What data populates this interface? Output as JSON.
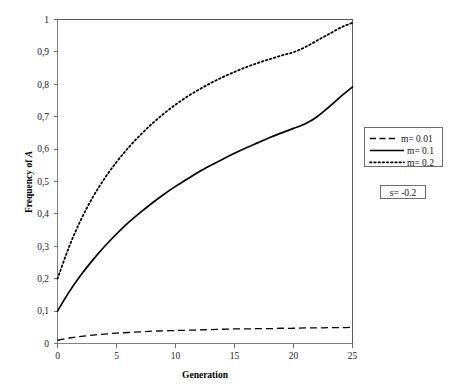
{
  "chart_data": {
    "type": "line",
    "title": "",
    "xlabel": "Generation",
    "ylabel": "Frequency of A",
    "ylabel_plain": "Frequency of ",
    "ylabel_italic": "A",
    "xlim": [
      0,
      25
    ],
    "ylim": [
      0,
      1
    ],
    "grid": false,
    "legend_position": "right",
    "x_tick_labels": [
      "0",
      "5",
      "10",
      "15",
      "20",
      "25"
    ],
    "x_tick_values": [
      0,
      5,
      10,
      15,
      20,
      25
    ],
    "y_tick_labels": [
      "0",
      "0,1",
      "0,2",
      "0,3",
      "0,4",
      "0,5",
      "0,6",
      "0,7",
      "0,8",
      "0,9",
      "1"
    ],
    "y_tick_values": [
      0,
      0.1,
      0.2,
      0.3,
      0.4,
      0.5,
      0.6,
      0.7,
      0.8,
      0.9,
      1
    ],
    "x": [
      0,
      1,
      2,
      3,
      4,
      5,
      6,
      7,
      8,
      9,
      10,
      11,
      12,
      13,
      14,
      15,
      16,
      17,
      18,
      19,
      20,
      21,
      22,
      23,
      24,
      25
    ],
    "series": [
      {
        "name": "m= 0.01",
        "style": "dashed",
        "color": "#000000",
        "values": [
          0.01,
          0.017,
          0.022,
          0.026,
          0.029,
          0.032,
          0.034,
          0.036,
          0.038,
          0.039,
          0.04,
          0.041,
          0.042,
          0.043,
          0.044,
          0.045,
          0.045,
          0.046,
          0.046,
          0.047,
          0.047,
          0.048,
          0.048,
          0.049,
          0.049,
          0.05
        ]
      },
      {
        "name": "m= 0.1",
        "style": "solid",
        "color": "#000000",
        "values": [
          0.1,
          0.16,
          0.212,
          0.258,
          0.3,
          0.338,
          0.373,
          0.404,
          0.433,
          0.46,
          0.485,
          0.508,
          0.53,
          0.55,
          0.569,
          0.587,
          0.604,
          0.62,
          0.636,
          0.65,
          0.664,
          0.678,
          0.7,
          0.73,
          0.762,
          0.792
        ]
      },
      {
        "name": "m= 0.2",
        "style": "dotted",
        "color": "#000000",
        "values": [
          0.2,
          0.3,
          0.383,
          0.452,
          0.51,
          0.56,
          0.604,
          0.643,
          0.678,
          0.709,
          0.737,
          0.762,
          0.784,
          0.804,
          0.822,
          0.838,
          0.853,
          0.866,
          0.878,
          0.889,
          0.899,
          0.915,
          0.935,
          0.955,
          0.975,
          0.99
        ]
      }
    ],
    "annotations": [
      {
        "text": "s= -0.2",
        "boxed": true
      }
    ]
  },
  "legend": {
    "entries": [
      {
        "label": "m= 0.01",
        "style": "dashed"
      },
      {
        "label": "m= 0.1",
        "style": "solid"
      },
      {
        "label": "m= 0.2",
        "style": "dotted"
      }
    ]
  },
  "annotation_box": {
    "label": "s= -0.2"
  }
}
